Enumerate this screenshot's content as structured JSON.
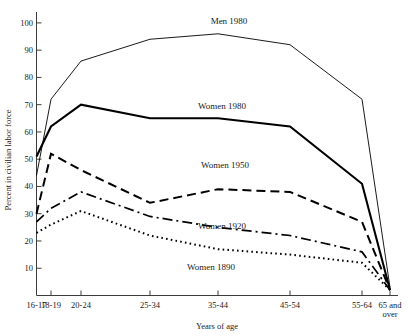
{
  "chart_data": {
    "type": "line",
    "title": "",
    "xlabel": "Years of age",
    "ylabel": "Percent in civilian labor force",
    "categories": [
      "16-17",
      "18-19",
      "20-24",
      "25-34",
      "35-44",
      "45-54",
      "55-64",
      "65 and over"
    ],
    "ylim": [
      0,
      104
    ],
    "yticks": [
      10,
      20,
      30,
      40,
      50,
      60,
      70,
      80,
      90,
      100
    ],
    "ytick_labels": [
      "10",
      "20",
      "30",
      "40",
      "50",
      "60",
      "70",
      "80",
      "90",
      "100"
    ],
    "grid": false,
    "legend_position": "inline-annotations",
    "series": [
      {
        "name": "Men 1980",
        "style": "thin-solid",
        "stroke_width": 0.9,
        "dash": "none",
        "values": [
          44,
          72,
          86,
          94,
          96,
          92,
          72,
          3
        ],
        "label": "Men 1980",
        "label_x": 229,
        "label_y": 24
      },
      {
        "name": "Women 1980",
        "style": "thick-solid",
        "stroke_width": 2.1,
        "dash": "none",
        "values": [
          51,
          62,
          70,
          65,
          65,
          62,
          41,
          2
        ],
        "label": "Women 1980",
        "label_x": 222,
        "label_y": 109
      },
      {
        "name": "Women 1950",
        "style": "dashed",
        "stroke_width": 2.0,
        "dash": "9,5",
        "values": [
          30,
          52,
          46,
          34,
          39,
          38,
          27,
          2
        ],
        "label": "Women 1950",
        "label_x": 225,
        "label_y": 168
      },
      {
        "name": "Women 1920",
        "style": "dash-dot",
        "stroke_width": 1.7,
        "dash": "10,4,2,4",
        "values": [
          27,
          32,
          38,
          29,
          25,
          22,
          16,
          2
        ],
        "label": "Women 1920",
        "label_x": 222,
        "label_y": 229
      },
      {
        "name": "Women 1890",
        "style": "dotted",
        "stroke_width": 2.0,
        "dash": "1.6,3.2",
        "values": [
          23,
          26,
          31,
          22,
          17,
          15,
          12,
          2
        ],
        "label": "Women 1890",
        "label_x": 211,
        "label_y": 270
      }
    ],
    "colors": {
      "axis": "#3d3d3d",
      "series": "#000000",
      "background": "#ffffff"
    }
  }
}
